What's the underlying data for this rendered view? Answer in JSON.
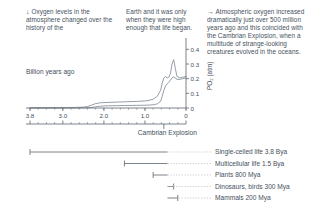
{
  "notes": [
    {
      "id": "oxygen-levels-note",
      "arrow": "↓",
      "text": "Oxygen levels in the atmosphere changed over the history of the"
    },
    {
      "id": "life-began-note",
      "arrow": "",
      "text": "Earth and it was only when they were high enough that life began."
    },
    {
      "id": "cambrian-explosion-note",
      "arrow": "→",
      "text": "Atmospheric oxygen increased dramatically just over 500 million years ago and this coincided with the Cambrian Explosion, when a multitude of strange-looking creatures evolved in the oceans."
    }
  ],
  "chart_data": {
    "type": "line",
    "title": "",
    "xlabel": "Billion years ago",
    "ylabel": "PO₂ (atm)",
    "x_ticks": [
      "3.8",
      "3.0",
      "2.0",
      "1.0",
      "0"
    ],
    "x_tick_values": [
      3.8,
      3.0,
      2.0,
      1.0,
      0
    ],
    "xlim": [
      3.8,
      0
    ],
    "y_ticks": [
      "0.4",
      "0.3",
      "0.2",
      "0.1",
      "0"
    ],
    "y_tick_values": [
      0.4,
      0.3,
      0.2,
      0.1,
      0
    ],
    "ylim": [
      0,
      0.45
    ],
    "grid": false,
    "legend": "none",
    "annotations": [
      {
        "label": "Cambrian Explosion",
        "x": 0.54
      }
    ],
    "series": [
      {
        "name": "Upper estimate",
        "x": [
          3.8,
          3.4,
          3.0,
          2.7,
          2.5,
          2.4,
          2.3,
          2.2,
          2.1,
          2.0,
          1.9,
          1.7,
          1.5,
          1.2,
          1.0,
          0.9,
          0.8,
          0.7,
          0.62,
          0.58,
          0.54,
          0.5,
          0.46,
          0.42,
          0.38,
          0.34,
          0.3,
          0.26,
          0.22,
          0.15,
          0.08,
          0.0
        ],
        "values": [
          0.002,
          0.002,
          0.003,
          0.004,
          0.006,
          0.01,
          0.02,
          0.03,
          0.035,
          0.037,
          0.038,
          0.04,
          0.042,
          0.045,
          0.048,
          0.052,
          0.06,
          0.08,
          0.12,
          0.17,
          0.205,
          0.215,
          0.205,
          0.21,
          0.235,
          0.3,
          0.33,
          0.27,
          0.215,
          0.205,
          0.21,
          0.215
        ]
      },
      {
        "name": "Lower estimate",
        "x": [
          3.8,
          3.4,
          3.0,
          2.7,
          2.5,
          2.4,
          2.3,
          2.2,
          2.1,
          2.0,
          1.9,
          1.7,
          1.5,
          1.2,
          1.0,
          0.9,
          0.8,
          0.7,
          0.62,
          0.58,
          0.54,
          0.5,
          0.46,
          0.42,
          0.38,
          0.34,
          0.3,
          0.26,
          0.22,
          0.15,
          0.08,
          0.0
        ],
        "values": [
          0.0,
          0.0,
          0.0,
          0.001,
          0.001,
          0.002,
          0.004,
          0.008,
          0.012,
          0.014,
          0.015,
          0.016,
          0.017,
          0.018,
          0.019,
          0.02,
          0.022,
          0.028,
          0.045,
          0.08,
          0.12,
          0.15,
          0.165,
          0.175,
          0.19,
          0.205,
          0.212,
          0.205,
          0.195,
          0.195,
          0.2,
          0.205
        ]
      }
    ]
  },
  "timeline": {
    "axis_ticks": [
      "3.8",
      "3.0",
      "2.0",
      "1.0",
      "0"
    ],
    "events": [
      {
        "label": "Single-celled life 3.8 Bya",
        "start": 3.8,
        "end": 0.45
      },
      {
        "label": "Multicellular life 1.5 Bya",
        "start": 1.5,
        "end": 0.45
      },
      {
        "label": "Plants 800 Mya",
        "start": 0.8,
        "end": 0.45
      },
      {
        "label": "Dinosaurs, birds 300 Mya",
        "start": 0.3,
        "end": 0.45
      },
      {
        "label": "Mammals 200 Mya",
        "start": 0.2,
        "end": 0.45
      }
    ]
  },
  "colors": {
    "ink": "#46515c",
    "line": "#8a939c",
    "rule": "#5a646e",
    "leader": "#b9c0c6"
  }
}
